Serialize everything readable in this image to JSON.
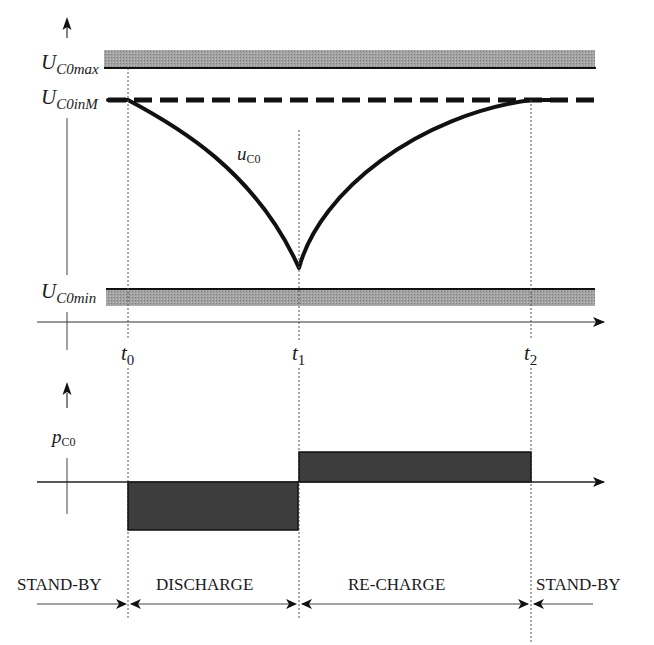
{
  "diagram": {
    "type": "timing-diagram",
    "upper_plot": {
      "y_axis_labels": {
        "max": {
          "main": "U",
          "sub": "C0max"
        },
        "in_max": {
          "main": "U",
          "sub": "C0inM"
        },
        "min": {
          "main": "U",
          "sub": "C0min"
        }
      },
      "curve_label": {
        "main": "u",
        "sub": "C0"
      },
      "time_labels": [
        {
          "main": "t",
          "sub": "0"
        },
        {
          "main": "t",
          "sub": "1"
        },
        {
          "main": "t",
          "sub": "2"
        }
      ]
    },
    "lower_plot": {
      "y_axis_label": {
        "main": "p",
        "sub": "C0"
      }
    },
    "phases": [
      {
        "label": "STAND-BY"
      },
      {
        "label": "DISCHARGE"
      },
      {
        "label": "RE-CHARGE"
      },
      {
        "label": "STAND-BY"
      }
    ],
    "colors": {
      "line": "#111111",
      "band_fill": "#9a9a9a",
      "pulse_fill": "#3a3a3a",
      "dotted": "#555555"
    }
  }
}
